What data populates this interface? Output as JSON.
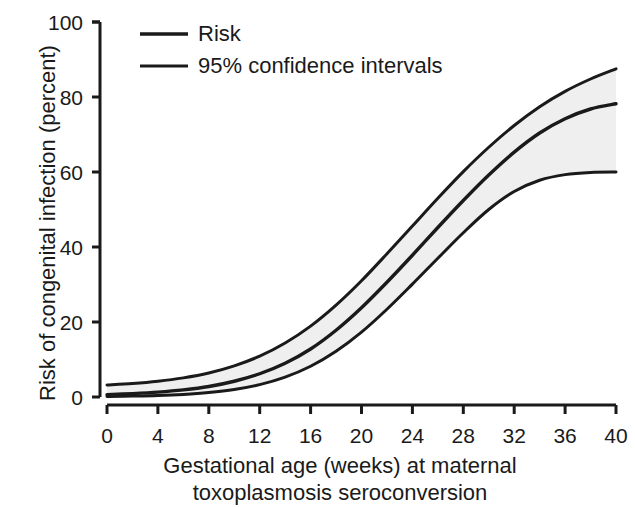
{
  "chart_data": {
    "type": "line",
    "title": "",
    "xlabel": "Gestational age (weeks) at maternal toxoplasmosis seroconversion",
    "xlabel_line1": "Gestational age (weeks) at maternal",
    "xlabel_line2": "toxoplasmosis seroconversion",
    "ylabel": "Risk of congenital infection (percent)",
    "xlim": [
      0,
      40
    ],
    "ylim": [
      0,
      100
    ],
    "xticks": [
      0,
      4,
      8,
      12,
      16,
      20,
      24,
      28,
      32,
      36,
      40
    ],
    "xtick_labels": [
      "0",
      "4",
      "8",
      "12",
      "16",
      "20",
      "24",
      "28",
      "32",
      "36",
      "40"
    ],
    "yticks": [
      0,
      20,
      40,
      60,
      80,
      100
    ],
    "ytick_labels": [
      "0",
      "20",
      "40",
      "60",
      "80",
      "100"
    ],
    "grid": false,
    "legend_position": "top-left-inside",
    "x": [
      0,
      2,
      4,
      6,
      8,
      10,
      12,
      14,
      16,
      18,
      20,
      22,
      24,
      26,
      28,
      30,
      32,
      34,
      36,
      38,
      40
    ],
    "series": [
      {
        "name": "Risk",
        "color": "#1a1a1a",
        "values": [
          0.6,
          0.9,
          1.3,
          1.9,
          2.8,
          4.2,
          6.2,
          9.0,
          12.8,
          17.8,
          23.8,
          30.6,
          37.8,
          45.2,
          52.4,
          59.2,
          65.3,
          70.4,
          74.2,
          76.8,
          78.2
        ]
      },
      {
        "name": "Upper 95% confidence interval",
        "color": "#1a1a1a",
        "values": [
          3.2,
          3.6,
          4.2,
          5.1,
          6.4,
          8.3,
          10.9,
          14.4,
          18.9,
          24.5,
          31.0,
          38.2,
          45.6,
          53.0,
          60.1,
          66.6,
          72.4,
          77.4,
          81.5,
          84.8,
          87.5
        ]
      },
      {
        "name": "Lower 95% confidence interval",
        "color": "#1a1a1a",
        "values": [
          0.15,
          0.25,
          0.4,
          0.7,
          1.2,
          2.0,
          3.3,
          5.3,
          8.2,
          12.2,
          17.3,
          23.4,
          30.1,
          37.0,
          43.8,
          50.0,
          54.8,
          57.8,
          59.3,
          59.9,
          60.0
        ]
      }
    ],
    "band_fill_color": "#efefef",
    "line_width_px": 3
  },
  "legend": {
    "items": [
      {
        "label": "Risk",
        "swatch": "line-swatch"
      },
      {
        "label": "95% confidence intervals",
        "swatch": "line-swatch"
      }
    ]
  },
  "axes": {
    "y_title": "Risk of congenital infection (percent)",
    "x_title_line1": "Gestational age (weeks) at maternal",
    "x_title_line2": "toxoplasmosis seroconversion",
    "ytick_labels": [
      "100",
      "80",
      "60",
      "40",
      "20",
      "0"
    ],
    "xtick_labels": [
      "0",
      "4",
      "8",
      "12",
      "16",
      "20",
      "24",
      "28",
      "32",
      "36",
      "40"
    ],
    "axis_color": "#1a1a1a"
  }
}
